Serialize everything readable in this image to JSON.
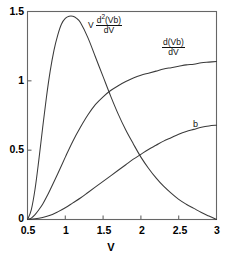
{
  "chart_data": {
    "type": "line",
    "title": "",
    "xlabel": "V",
    "ylabel": "",
    "xlim": [
      0.5,
      3
    ],
    "ylim": [
      0,
      1.5
    ],
    "grid": false,
    "legend_position": "inline-annotations",
    "xticks": [
      "0.5",
      "1",
      "1.5",
      "2",
      "2.5",
      "3"
    ],
    "xtick_values": [
      0.5,
      1,
      1.5,
      2,
      2.5,
      3
    ],
    "yticks": [
      "0",
      "0.5",
      "1",
      "1.5"
    ],
    "ytick_values": [
      0,
      0.5,
      1,
      1.5
    ],
    "series": [
      {
        "name": "V d2(Vb)/dV",
        "label_parts": {
          "lead": "V",
          "numerator": "d",
          "exponent": "2",
          "numerator_tail": "(Vb)",
          "denominator": "dV"
        },
        "x": [
          0.5,
          0.55,
          0.6,
          0.65,
          0.7,
          0.75,
          0.8,
          0.85,
          0.9,
          0.95,
          1.0,
          1.05,
          1.1,
          1.15,
          1.2,
          1.3,
          1.4,
          1.5,
          1.6,
          1.7,
          1.8,
          1.9,
          2.0,
          2.1,
          2.2,
          2.3,
          2.4,
          2.5,
          2.6,
          2.7,
          2.8,
          2.9,
          3.0
        ],
        "y": [
          0.0,
          0.07,
          0.22,
          0.43,
          0.66,
          0.88,
          1.07,
          1.22,
          1.33,
          1.41,
          1.45,
          1.465,
          1.465,
          1.45,
          1.42,
          1.31,
          1.17,
          1.03,
          0.89,
          0.76,
          0.645,
          0.545,
          0.45,
          0.37,
          0.3,
          0.24,
          0.19,
          0.145,
          0.11,
          0.08,
          0.05,
          0.025,
          0.0
        ]
      },
      {
        "name": "d(Vb)/dV",
        "label_parts": {
          "lead": "",
          "numerator": "d(Vb)",
          "exponent": "",
          "numerator_tail": "",
          "denominator": "dV"
        },
        "x": [
          0.5,
          0.55,
          0.6,
          0.65,
          0.7,
          0.75,
          0.8,
          0.9,
          1.0,
          1.1,
          1.2,
          1.3,
          1.4,
          1.5,
          1.6,
          1.7,
          1.8,
          1.9,
          2.0,
          2.1,
          2.2,
          2.3,
          2.4,
          2.5,
          2.6,
          2.7,
          2.8,
          2.9,
          3.0
        ],
        "y": [
          0.0,
          0.01,
          0.035,
          0.07,
          0.11,
          0.16,
          0.215,
          0.33,
          0.45,
          0.565,
          0.665,
          0.755,
          0.83,
          0.885,
          0.93,
          0.965,
          0.995,
          1.02,
          1.04,
          1.055,
          1.07,
          1.085,
          1.095,
          1.105,
          1.115,
          1.12,
          1.13,
          1.135,
          1.14
        ]
      },
      {
        "name": "b",
        "label_parts": {
          "lead": "b",
          "numerator": "",
          "exponent": "",
          "numerator_tail": "",
          "denominator": ""
        },
        "x": [
          0.5,
          0.6,
          0.7,
          0.8,
          0.9,
          1.0,
          1.1,
          1.2,
          1.3,
          1.4,
          1.5,
          1.6,
          1.7,
          1.8,
          1.9,
          2.0,
          2.1,
          2.2,
          2.3,
          2.4,
          2.5,
          2.6,
          2.7,
          2.8,
          2.9,
          3.0
        ],
        "y": [
          0.0,
          0.005,
          0.015,
          0.03,
          0.055,
          0.085,
          0.12,
          0.155,
          0.195,
          0.235,
          0.275,
          0.315,
          0.355,
          0.395,
          0.435,
          0.47,
          0.505,
          0.535,
          0.565,
          0.59,
          0.615,
          0.635,
          0.65,
          0.665,
          0.675,
          0.68
        ]
      }
    ]
  },
  "axes": {
    "x_title": "V",
    "y_title": ""
  },
  "colors": {
    "line": "#3a3a3a",
    "axis": "#555555",
    "background": "#ffffff",
    "text": "#000000"
  },
  "annotations": {
    "series1_lead": "V",
    "series1_num": "d",
    "series1_sup": "2",
    "series1_num_tail": "(Vb)",
    "series1_den": "dV",
    "series2_num": "d(Vb)",
    "series2_den": "dV",
    "series3_label": "b"
  }
}
